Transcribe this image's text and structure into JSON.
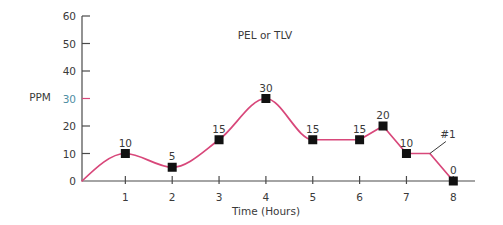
{
  "chart_data": {
    "type": "line",
    "title": "",
    "annotation": "PEL or TLV",
    "xlabel": "Time (Hours)",
    "ylabel": "PPM",
    "xlim": [
      0,
      8.5
    ],
    "ylim": [
      0,
      60
    ],
    "x_ticks": [
      1,
      2,
      3,
      4,
      5,
      6,
      7,
      8
    ],
    "y_ticks": [
      0,
      10,
      20,
      30,
      40,
      50,
      60
    ],
    "grid": false,
    "legend": null,
    "pel_tlv_tick": {
      "value": 30,
      "label": "PEL or TLV",
      "tick_color": "#d8477a",
      "label_color": "#4f8ea3"
    },
    "series": [
      {
        "name": "Exposure concentration",
        "color": "#d8477a",
        "x": [
          0,
          1,
          2,
          3,
          4,
          5,
          6,
          6.5,
          7,
          7.5,
          8
        ],
        "y": [
          0,
          10,
          5,
          15,
          30,
          15,
          15,
          20,
          10,
          10,
          0
        ],
        "point_labels": [
          "",
          "10",
          "5",
          "15",
          "30",
          "15",
          "15",
          "20",
          "10",
          "",
          "0"
        ],
        "markers": [
          false,
          true,
          true,
          true,
          true,
          true,
          true,
          true,
          true,
          false,
          true
        ],
        "smooth_until_x": 6
      }
    ],
    "callout": {
      "label": "#1",
      "x": 7.5,
      "y": 10
    }
  },
  "colors": {
    "line": "#d8477a",
    "marker": "#111111",
    "axis": "#4a4a4a",
    "text": "#3a3a3a"
  }
}
